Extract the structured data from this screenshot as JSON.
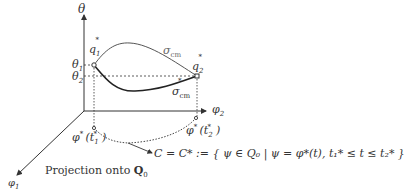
{
  "diagram": {
    "axes": {
      "vertical": "θ",
      "horizontal": "φ",
      "horizontal_sub": "2",
      "depth": "φ",
      "depth_sub": "1"
    },
    "levels": {
      "theta1": "θ",
      "theta1_sub": "1",
      "theta2": "θ",
      "theta2_sub": "2"
    },
    "points": {
      "q1": "q",
      "q1_sub": "1",
      "q1_sup": "*",
      "q2": "q",
      "q2_sub": "2",
      "q2_sup": "*"
    },
    "curves": {
      "upper": "σ",
      "upper_sub": "cm",
      "lower": "σ",
      "lower_sub": "cm",
      "lower_sup": "*"
    },
    "projections": {
      "p1": "φ",
      "p1_sup": "*",
      "p1_arg": "(t",
      "p1_arg_sub": "1",
      "p1_arg_sup": "*",
      "p1_close": ")",
      "p2": "φ",
      "p2_sup": "*",
      "p2_arg": "(t",
      "p2_arg_sub": "2",
      "p2_arg_sup": "*",
      "p2_close": ")"
    },
    "caption": "Projection onto",
    "caption_space": "Q",
    "caption_space_sub": "0",
    "definition": "C = C* := { ψ ∈ Q₀ | ψ = φ*(t), t₁* ≤ t ≤ t₂* }"
  }
}
